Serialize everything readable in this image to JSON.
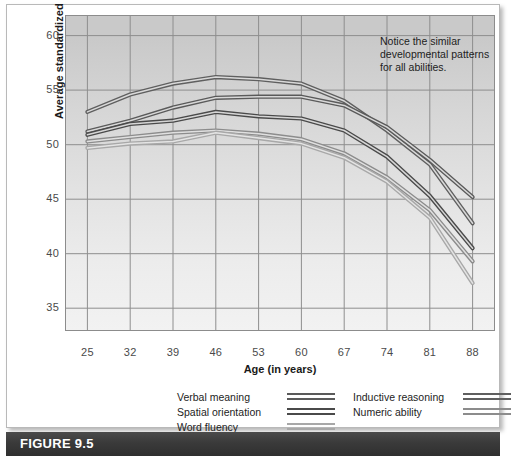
{
  "figure": {
    "caption": "FIGURE 9.5",
    "annotation": "Notice the similar developmental patterns for all abilities."
  },
  "legend": {
    "left_column": [
      {
        "label": "Verbal meaning",
        "color": "#5a5a5a",
        "swatch": "line-swatch"
      },
      {
        "label": "Spatial orientation",
        "color": "#4a4a4a",
        "swatch": "line-swatch"
      },
      {
        "label": "Word fluency",
        "color": "#a8a8a8",
        "swatch": "line-swatch"
      }
    ],
    "right_column": [
      {
        "label": "Inductive reasoning",
        "color": "#5f5f5f",
        "swatch": "line-swatch"
      },
      {
        "label": "Numeric ability",
        "color": "#8c8c8c",
        "swatch": "line-swatch"
      }
    ]
  },
  "chart_data": {
    "type": "line",
    "title": "",
    "xlabel": "Age (in years)",
    "ylabel": "Average standardized score",
    "x": [
      25,
      32,
      39,
      46,
      53,
      60,
      67,
      74,
      81,
      88
    ],
    "xticks": [
      "25",
      "32",
      "39",
      "46",
      "53",
      "60",
      "67",
      "74",
      "81",
      "88"
    ],
    "yticks": [
      "35",
      "40",
      "45",
      "50",
      "55",
      "60"
    ],
    "ylim": [
      33.0,
      61.8
    ],
    "xlim": [
      21.5,
      91.5
    ],
    "grid": true,
    "legend_position": "below-plot",
    "series": [
      {
        "name": "Inductive reasoning",
        "color": "#5f5f5f",
        "values": [
          53.0,
          54.6,
          55.6,
          56.2,
          56.0,
          55.6,
          54.0,
          51.3,
          48.2,
          42.8
        ]
      },
      {
        "name": "Verbal meaning",
        "color": "#5a5a5a",
        "values": [
          51.2,
          52.2,
          53.4,
          54.3,
          54.4,
          54.4,
          53.6,
          51.6,
          48.6,
          45.2
        ]
      },
      {
        "name": "Spatial orientation",
        "color": "#4a4a4a",
        "values": [
          50.9,
          51.9,
          52.2,
          53.0,
          52.6,
          52.4,
          51.3,
          48.9,
          45.3,
          40.5
        ]
      },
      {
        "name": "Numeric ability",
        "color": "#8c8c8c",
        "values": [
          50.3,
          50.7,
          51.1,
          51.3,
          51.0,
          50.5,
          49.2,
          47.0,
          44.0,
          39.3
        ]
      },
      {
        "name": "Word fluency",
        "color": "#a8a8a8",
        "values": [
          49.7,
          50.1,
          50.3,
          51.1,
          50.6,
          50.1,
          48.8,
          46.6,
          43.3,
          37.3
        ]
      }
    ]
  }
}
